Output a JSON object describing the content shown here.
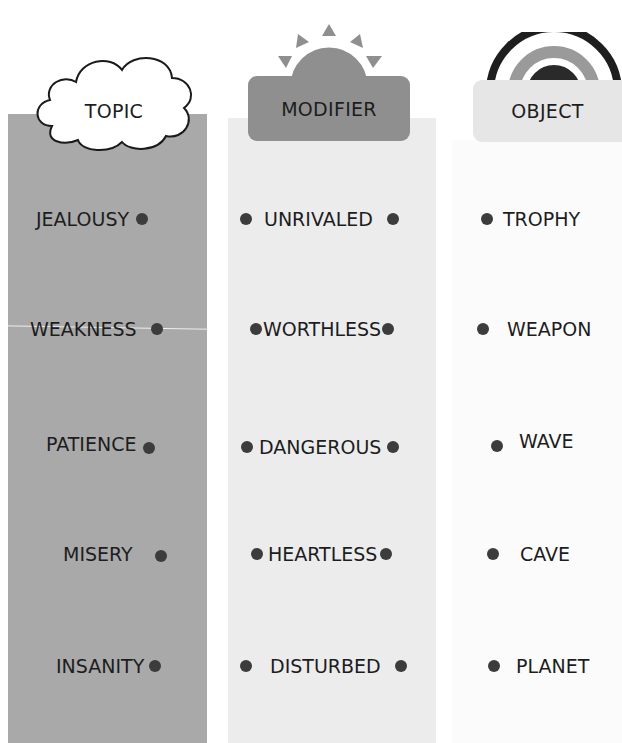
{
  "headers": {
    "topic": "TOPIC",
    "modifier": "MODIFIER",
    "object": "OBJECT"
  },
  "icons": {
    "topic": "cloud-icon",
    "modifier": "sun-icon",
    "object": "rainbow-icon"
  },
  "colors": {
    "topic_column": "#a9a9a9",
    "modifier_column": "#ececec",
    "modifier_header": "#8f8f8f",
    "object_header": "#e6e6e6",
    "dot": "#3c3c3c"
  },
  "topics": [
    "JEALOUSY",
    "WEAKNESS",
    "PATIENCE",
    "MISERY",
    "INSANITY"
  ],
  "modifiers": [
    "UNRIVALED",
    "WORTHLESS",
    "DANGEROUS",
    "HEARTLESS",
    "DISTURBED"
  ],
  "objects": [
    "TROPHY",
    "WEAPON",
    "WAVE",
    "CAVE",
    "PLANET"
  ]
}
